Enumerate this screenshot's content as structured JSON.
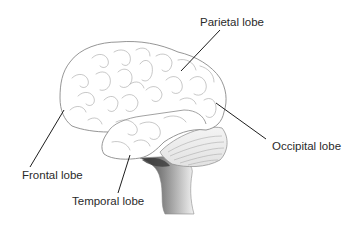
{
  "diagram": {
    "labels": [
      {
        "id": "parietal",
        "text": "Parietal lobe"
      },
      {
        "id": "occipital",
        "text": "Occipital lobe"
      },
      {
        "id": "frontal",
        "text": "Frontal lobe"
      },
      {
        "id": "temporal",
        "text": "Temporal lobe"
      }
    ],
    "colors": {
      "outline": "#8a8a8a",
      "leader_line": "#1e1e1e",
      "label_text": "#2a2a2a",
      "brainstem_shade": "#5a5a5a",
      "background": "#ffffff"
    }
  }
}
